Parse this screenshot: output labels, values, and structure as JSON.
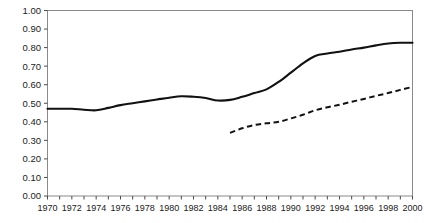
{
  "chart_data": {
    "type": "line",
    "title": "",
    "subtitle": "",
    "xlabel": "",
    "ylabel": "",
    "xlim": [
      1970,
      2000
    ],
    "ylim": [
      0.0,
      1.0
    ],
    "grid": false,
    "legend_position": "none",
    "y_ticks": [
      "0.00",
      "0.10",
      "0.20",
      "0.30",
      "0.40",
      "0.50",
      "0.60",
      "0.70",
      "0.80",
      "0.90",
      "1.00"
    ],
    "y_tick_values": [
      0.0,
      0.1,
      0.2,
      0.3,
      0.4,
      0.5,
      0.6,
      0.7,
      0.8,
      0.9,
      1.0
    ],
    "x_ticks": [
      "1970",
      "1972",
      "1974",
      "1976",
      "1978",
      "1980",
      "1982",
      "1984",
      "1986",
      "1988",
      "1990",
      "1992",
      "1994",
      "1996",
      "1998",
      "2000"
    ],
    "x_tick_values": [
      1970,
      1972,
      1974,
      1976,
      1978,
      1980,
      1982,
      1984,
      1986,
      1988,
      1990,
      1992,
      1994,
      1996,
      1998,
      2000
    ],
    "x_minor_ticks": [
      1970,
      1971,
      1972,
      1973,
      1974,
      1975,
      1976,
      1977,
      1978,
      1979,
      1980,
      1981,
      1982,
      1983,
      1984,
      1985,
      1986,
      1987,
      1988,
      1989,
      1990,
      1991,
      1992,
      1993,
      1994,
      1995,
      1996,
      1997,
      1998,
      1999,
      2000
    ],
    "series": [
      {
        "name": "solid-series",
        "style": "solid",
        "color": "#111111",
        "x": [
          1970,
          1971,
          1972,
          1973,
          1974,
          1975,
          1976,
          1977,
          1978,
          1979,
          1980,
          1981,
          1982,
          1983,
          1984,
          1985,
          1986,
          1987,
          1988,
          1989,
          1990,
          1991,
          1992,
          1993,
          1994,
          1995,
          1996,
          1997,
          1998,
          1999,
          2000
        ],
        "values": [
          0.47,
          0.47,
          0.47,
          0.465,
          0.462,
          0.475,
          0.49,
          0.5,
          0.51,
          0.52,
          0.53,
          0.538,
          0.535,
          0.528,
          0.515,
          0.518,
          0.535,
          0.555,
          0.575,
          0.615,
          0.665,
          0.715,
          0.755,
          0.768,
          0.778,
          0.79,
          0.8,
          0.812,
          0.822,
          0.826,
          0.826
        ]
      },
      {
        "name": "dashed-series",
        "style": "dashed",
        "color": "#111111",
        "x": [
          1985,
          1986,
          1987,
          1988,
          1989,
          1990,
          1991,
          1992,
          1993,
          1994,
          1995,
          1996,
          1997,
          1998,
          1999,
          2000
        ],
        "values": [
          0.34,
          0.365,
          0.383,
          0.392,
          0.4,
          0.418,
          0.438,
          0.462,
          0.478,
          0.492,
          0.508,
          0.523,
          0.54,
          0.555,
          0.572,
          0.588
        ]
      }
    ]
  },
  "axes": {
    "frame_color": "#8a8a8a",
    "tick_color": "#4a4a4a",
    "label_color": "#1a1a1a"
  }
}
